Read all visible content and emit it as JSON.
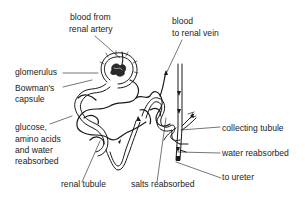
{
  "diagram": {
    "colors": {
      "line": "#1a1a1a",
      "background": "#ffffff",
      "text": "#1c1c1c"
    },
    "labels": {
      "blood_from_artery_1": "blood from",
      "blood_from_artery_2": "renal artery",
      "blood_to_vein_1": "blood",
      "blood_to_vein_2": "to renal vein",
      "glomerulus": "glomerulus",
      "bowmans_1": "Bowman's",
      "bowmans_2": "capsule",
      "glucose_1": "glucose,",
      "glucose_2": "amino acids",
      "glucose_3": "and water",
      "glucose_4": "reabsorbed",
      "renal_tubule": "renal tubule",
      "salts_reabsorbed": "salts reabsorbed",
      "collecting_tubule": "collecting tubule",
      "water_reabsorbed": "water reabsorbed",
      "to_ureter": "to ureter"
    }
  }
}
